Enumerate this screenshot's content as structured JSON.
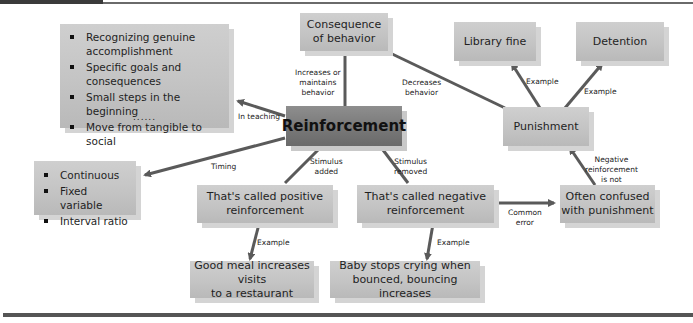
{
  "colors": {
    "box_fill": "#c6c6c6",
    "main_fill": "#7a7a7a",
    "link": "#5a5a5a",
    "shadow": "#d4d4d4"
  },
  "nodes": {
    "reinforcement": "Reinforcement",
    "consequence": "Consequence of behavior",
    "consequence_l1": "Consequence",
    "consequence_l2": "of behavior",
    "library_fine": "Library fine",
    "detention": "Detention",
    "punishment": "Punishment",
    "positive_l1": "That's called positive",
    "positive_l2": "reinforcement",
    "negative_l1": "That's called negative",
    "negative_l2": "reinforcement",
    "confused_l1": "Often confused",
    "confused_l2": "with punishment",
    "meal_l1": "Good meal increases visits",
    "meal_l2": "to a restaurant",
    "baby_l1": "Baby stops crying when",
    "baby_l2": "bounced, bouncing increases"
  },
  "teaching_list": {
    "items": [
      "Recognizing genuine accomplishment",
      "Specific goals and consequences",
      "Small steps in the beginning",
      "Move from tangible to social"
    ],
    "more": "......"
  },
  "timing_list": {
    "items": [
      "Continuous",
      "Fixed variable",
      "Interval ratio"
    ]
  },
  "edge_labels": {
    "increases_l1": "Increases or",
    "increases_l2": "maintains",
    "increases_l3": "behavior",
    "decreases_l1": "Decreases",
    "decreases_l2": "behavior",
    "in_teaching": "In teaching",
    "timing": "Timing",
    "stim_added_l1": "Stimulus",
    "stim_added_l2": "added",
    "stim_removed_l1": "Stimulus",
    "stim_removed_l2": "removed",
    "example_libfine": "Example",
    "example_detention": "Example",
    "example_positive": "Example",
    "example_negative": "Example",
    "common_l1": "Common",
    "common_l2": "error",
    "neg_not_l1": "Negative",
    "neg_not_l2": "reinforcement",
    "neg_not_l3": "is not"
  }
}
